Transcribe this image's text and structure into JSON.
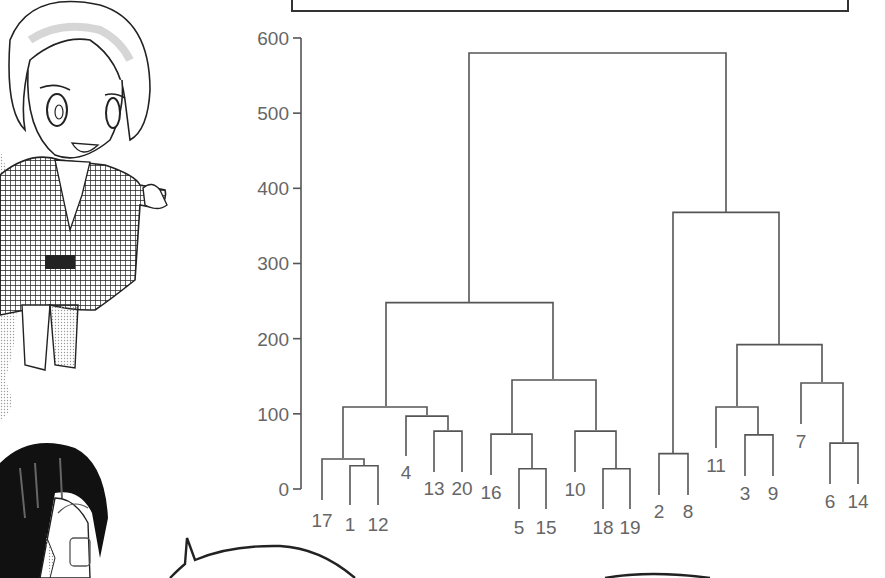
{
  "page": {
    "type": "manga-page-with-dendrogram",
    "title_box": {
      "text_visible": "",
      "dots": 2
    },
    "illustrations": [
      {
        "name": "character-in-checkered-haori",
        "position": "top-left",
        "pose": "pointing-right"
      },
      {
        "name": "character-with-glasses-dark-hair",
        "position": "bottom-left"
      },
      {
        "name": "speech-bubble",
        "position": "bottom-center"
      },
      {
        "name": "speech-bubble-2",
        "position": "bottom-right"
      }
    ]
  },
  "chart_data": {
    "type": "dendrogram",
    "title": "",
    "xlabel": "",
    "ylabel": "",
    "ylim": [
      0,
      600
    ],
    "yticks": [
      0,
      100,
      200,
      300,
      400,
      500,
      600
    ],
    "grid": false,
    "legend": null,
    "leaf_order": [
      "17",
      "1",
      "12",
      "4",
      "13",
      "20",
      "16",
      "5",
      "15",
      "10",
      "18",
      "19",
      "2",
      "8",
      "11",
      "3",
      "9",
      "7",
      "6",
      "14"
    ],
    "leaves": [
      {
        "label": "17",
        "x": 322,
        "bottom": 500
      },
      {
        "label": "1",
        "x": 350,
        "bottom": 505
      },
      {
        "label": "12",
        "x": 378,
        "bottom": 505
      },
      {
        "label": "4",
        "x": 406,
        "bottom": 456
      },
      {
        "label": "13",
        "x": 434,
        "bottom": 472
      },
      {
        "label": "20",
        "x": 462,
        "bottom": 472
      },
      {
        "label": "16",
        "x": 491,
        "bottom": 475
      },
      {
        "label": "5",
        "x": 519,
        "bottom": 509
      },
      {
        "label": "15",
        "x": 546,
        "bottom": 509
      },
      {
        "label": "10",
        "x": 575,
        "bottom": 472
      },
      {
        "label": "18",
        "x": 603,
        "bottom": 509
      },
      {
        "label": "19",
        "x": 630,
        "bottom": 509
      },
      {
        "label": "2",
        "x": 659,
        "bottom": 495
      },
      {
        "label": "8",
        "x": 688,
        "bottom": 495
      },
      {
        "label": "11",
        "x": 716,
        "bottom": 448
      },
      {
        "label": "3",
        "x": 745,
        "bottom": 476
      },
      {
        "label": "9",
        "x": 773,
        "bottom": 476
      },
      {
        "label": "7",
        "x": 801,
        "bottom": 424
      },
      {
        "label": "6",
        "x": 830,
        "bottom": 484
      },
      {
        "label": "14",
        "x": 858,
        "bottom": 484
      }
    ],
    "merges": [
      {
        "members": [
          "1",
          "12"
        ],
        "height": 31,
        "left": 350,
        "right": 378,
        "lbot": 505,
        "rbot": 505
      },
      {
        "members": [
          "17",
          "1,12"
        ],
        "height": 40,
        "left": 322,
        "right": 364,
        "lbot": 500,
        "rbot": 465
      },
      {
        "members": [
          "13",
          "20"
        ],
        "height": 77,
        "left": 434,
        "right": 462,
        "lbot": 472,
        "rbot": 472
      },
      {
        "members": [
          "4",
          "13,20"
        ],
        "height": 97,
        "left": 406,
        "right": 448,
        "lbot": 456,
        "rbot": 430
      },
      {
        "members": [
          "17,1,12",
          "4,13,20"
        ],
        "height": 109,
        "left": 343,
        "right": 427,
        "lbot": 458,
        "rbot": 415
      },
      {
        "members": [
          "5",
          "15"
        ],
        "height": 27,
        "left": 519,
        "right": 546,
        "lbot": 509,
        "rbot": 509
      },
      {
        "members": [
          "16",
          "5,15"
        ],
        "height": 73,
        "left": 491,
        "right": 532,
        "lbot": 475,
        "rbot": 468
      },
      {
        "members": [
          "18",
          "19"
        ],
        "height": 27,
        "left": 603,
        "right": 630,
        "lbot": 509,
        "rbot": 509
      },
      {
        "members": [
          "10",
          "18,19"
        ],
        "height": 77,
        "left": 575,
        "right": 616,
        "lbot": 472,
        "rbot": 468
      },
      {
        "members": [
          "16,5,15",
          "10,18,19"
        ],
        "height": 145,
        "left": 512,
        "right": 596,
        "lbot": 433,
        "rbot": 430
      },
      {
        "members": [
          "17,1,12,4,13,20",
          "16,5,15,10,18,19"
        ],
        "height": 248,
        "left": 386,
        "right": 553,
        "lbot": 406,
        "rbot": 379
      },
      {
        "members": [
          "2",
          "8"
        ],
        "height": 47,
        "left": 659,
        "right": 688,
        "lbot": 495,
        "rbot": 495
      },
      {
        "members": [
          "3",
          "9"
        ],
        "height": 72,
        "left": 745,
        "right": 773,
        "lbot": 476,
        "rbot": 476
      },
      {
        "members": [
          "11",
          "3,9"
        ],
        "height": 109,
        "left": 716,
        "right": 758,
        "lbot": 448,
        "rbot": 434
      },
      {
        "members": [
          "6",
          "14"
        ],
        "height": 61,
        "left": 830,
        "right": 858,
        "lbot": 484,
        "rbot": 484
      },
      {
        "members": [
          "7",
          "6,14"
        ],
        "height": 141,
        "left": 801,
        "right": 843,
        "lbot": 424,
        "rbot": 442
      },
      {
        "members": [
          "11,3,9",
          "7,6,14"
        ],
        "height": 192,
        "left": 737,
        "right": 822,
        "lbot": 406,
        "rbot": 382
      },
      {
        "members": [
          "2,8",
          "11,3,9,7,6,14"
        ],
        "height": 368,
        "left": 673,
        "right": 779,
        "lbot": 453,
        "rbot": 344
      },
      {
        "members": [
          "left_cluster",
          "right_cluster"
        ],
        "height": 580,
        "left": 469,
        "right": 726,
        "lbot": 302,
        "rbot": 212
      }
    ],
    "axis": {
      "x": 301,
      "y_top": 38,
      "y_zero": 489,
      "px_per_unit": 0.7517
    },
    "label_positions": [
      {
        "label": "17",
        "x": 322,
        "y": 527
      },
      {
        "label": "1",
        "x": 350,
        "y": 531
      },
      {
        "label": "12",
        "x": 378,
        "y": 531
      },
      {
        "label": "4",
        "x": 406,
        "y": 479
      },
      {
        "label": "13",
        "x": 434,
        "y": 495
      },
      {
        "label": "20",
        "x": 462,
        "y": 495
      },
      {
        "label": "16",
        "x": 491,
        "y": 499
      },
      {
        "label": "5",
        "x": 519,
        "y": 534
      },
      {
        "label": "15",
        "x": 546,
        "y": 534
      },
      {
        "label": "10",
        "x": 575,
        "y": 496
      },
      {
        "label": "18",
        "x": 603,
        "y": 534
      },
      {
        "label": "19",
        "x": 630,
        "y": 534
      },
      {
        "label": "2",
        "x": 659,
        "y": 518
      },
      {
        "label": "8",
        "x": 688,
        "y": 518
      },
      {
        "label": "11",
        "x": 716,
        "y": 472
      },
      {
        "label": "3",
        "x": 745,
        "y": 500
      },
      {
        "label": "9",
        "x": 773,
        "y": 500
      },
      {
        "label": "7",
        "x": 801,
        "y": 448
      },
      {
        "label": "6",
        "x": 830,
        "y": 508
      },
      {
        "label": "14",
        "x": 858,
        "y": 508
      }
    ]
  }
}
